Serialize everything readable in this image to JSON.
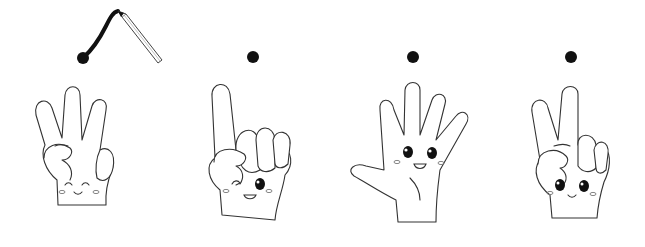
{
  "scene": {
    "description": "Four cartoon hands showing finger counts with dots above; first dot has a pencil drawing a curved line",
    "background": "#ffffff",
    "line_color": "#333333",
    "dot_color": "#111111"
  },
  "figures": [
    {
      "id": "hand-1",
      "fingers_up": 3,
      "expression": "happy-closed-eyes",
      "dot": "dot-with-pencil-stroke"
    },
    {
      "id": "hand-2",
      "fingers_up": 1,
      "expression": "winking",
      "dot": "dot"
    },
    {
      "id": "hand-3",
      "fingers_up": 5,
      "expression": "smiling-open-eyes",
      "dot": "dot"
    },
    {
      "id": "hand-4",
      "fingers_up": 2,
      "expression": "smiling-open-eyes",
      "dot": "dot"
    }
  ]
}
